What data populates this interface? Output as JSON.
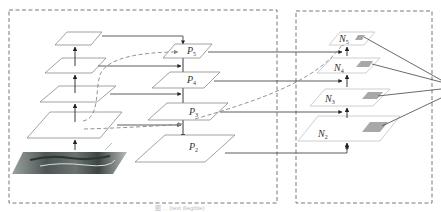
{
  "diagram": {
    "type": "feature-pyramid-network-with-bottom-up-path-augmentation",
    "panels": [
      {
        "id": "backbone-fpn",
        "label": ""
      },
      {
        "id": "bottom-up-path",
        "label": ""
      }
    ],
    "backbone_levels": [
      "C2",
      "C3",
      "C4",
      "C5"
    ],
    "fpn_levels": [
      {
        "label": "P",
        "sub": "5"
      },
      {
        "label": "P",
        "sub": "4"
      },
      {
        "label": "P",
        "sub": "3"
      },
      {
        "label": "P",
        "sub": "2"
      }
    ],
    "augmented_levels": [
      {
        "label": "N",
        "sub": "5"
      },
      {
        "label": "N",
        "sub": "4"
      },
      {
        "label": "N",
        "sub": "3"
      },
      {
        "label": "N",
        "sub": "2"
      }
    ],
    "input_image": "aerial-ship-image",
    "caption": "图 ... (text illegible)",
    "colors": {
      "plane_stroke": "#8a8a8a",
      "n_plane_stroke": "#c8c8c8",
      "arrow": "#333333",
      "dashed_path": "#888888",
      "roi_patch": "#a8a8a8",
      "panel_border": "#555555"
    }
  }
}
